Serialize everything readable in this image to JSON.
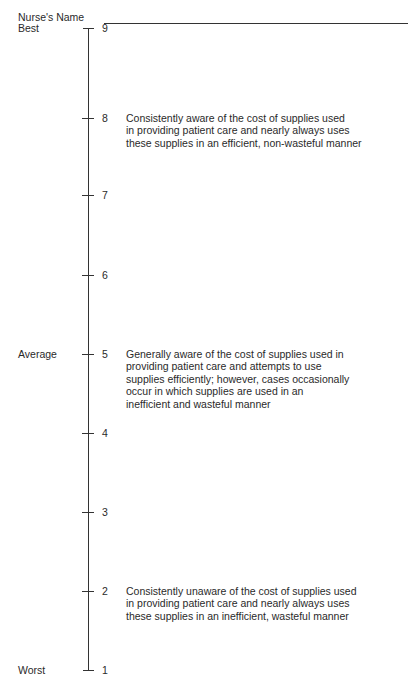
{
  "form": {
    "name_label": "Nurse's Name"
  },
  "scale": {
    "anchors": {
      "best": "Best",
      "average": "Average",
      "worst": "Worst"
    },
    "points": [
      {
        "value": "9",
        "y": 28
      },
      {
        "value": "8",
        "y": 118
      },
      {
        "value": "7",
        "y": 195
      },
      {
        "value": "6",
        "y": 275
      },
      {
        "value": "5",
        "y": 354
      },
      {
        "value": "4",
        "y": 433
      },
      {
        "value": "3",
        "y": 512
      },
      {
        "value": "2",
        "y": 591
      },
      {
        "value": "1",
        "y": 670
      }
    ],
    "descriptions": {
      "d8": [
        "Consistently aware of the cost of supplies used",
        "in providing patient care and nearly always uses",
        "these supplies in an efficient, non-wasteful manner"
      ],
      "d5": [
        "Generally aware of the cost of supplies used in",
        "providing patient care and attempts to use",
        "supplies efficiently; however, cases occasionally",
        "occur in which supplies are used in an",
        "inefficient and wasteful manner"
      ],
      "d2": [
        "Consistently unaware of the cost of supplies used",
        "in providing patient care and nearly always uses",
        "these supplies in an inefficient, wasteful manner"
      ]
    }
  }
}
